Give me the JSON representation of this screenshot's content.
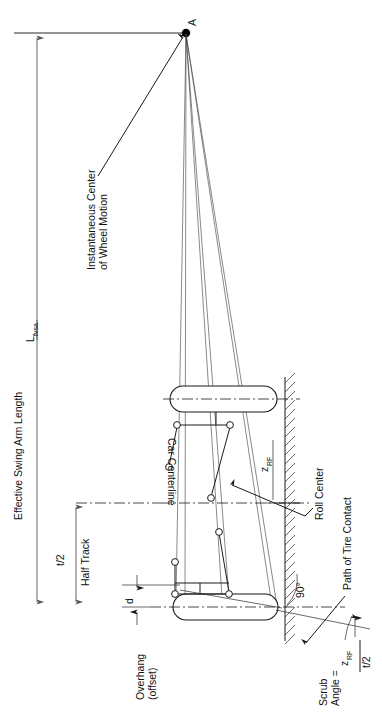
{
  "figure": {
    "labels": {
      "point_a": "A",
      "effective_swing_arm": "Effective Swing Arm Length",
      "effective_swing_arm_symbol": "L",
      "effective_swing_arm_subscript": "fvsa",
      "instant_center_line1": "Instantaneous Center",
      "instant_center_line2": "of Wheel Motion",
      "half_track_symbol": "t/2",
      "half_track": "Half Track",
      "car_centerline": "Car Centerline",
      "overhang_line1": "Overhang",
      "overhang_line2": "(offset)",
      "overhang_symbol": "d",
      "roll_center": "Roll Center",
      "roll_center_height_symbol": "z",
      "roll_center_height_subscript": "RF",
      "path_of_tire_contact": "Path of Tire Contact",
      "right_angle": "90°",
      "scrub_line1": "Scrub",
      "scrub_line2": "Angle =",
      "scrub_numerator_symbol": "z",
      "scrub_numerator_subscript": "RF",
      "scrub_denominator": "t/2"
    },
    "colors": {
      "ink": "#1a1a1a",
      "dimension": "#555555",
      "background": "#ffffff",
      "top_rule": "#707070"
    }
  }
}
